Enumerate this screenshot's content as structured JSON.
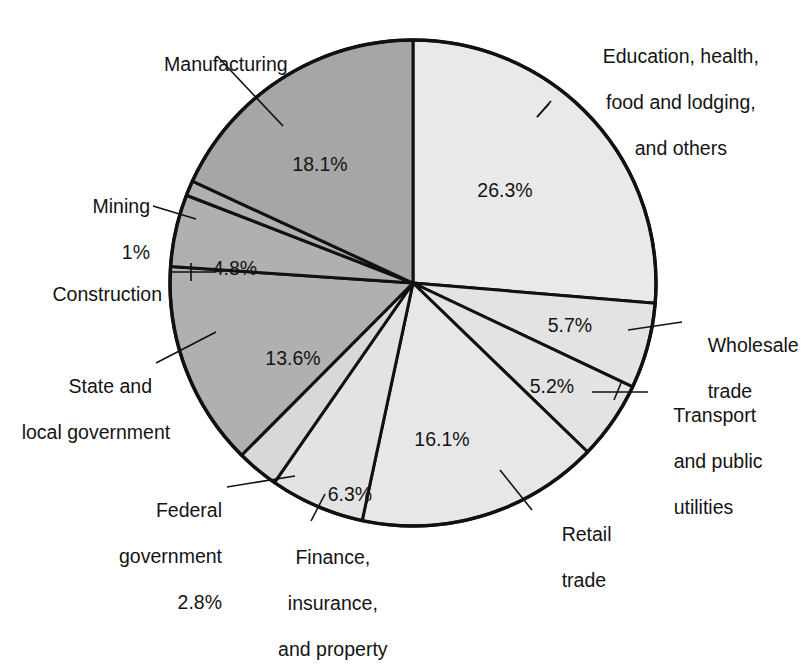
{
  "chart_data": {
    "type": "pie",
    "title": "",
    "subtitle": "",
    "xlabel": "",
    "ylabel": "",
    "legend_position": "none",
    "grid": false,
    "labels_outside": true,
    "total": 100,
    "units": "percent",
    "categories": [
      "Education, health, food and lodging, and others",
      "Wholesale trade",
      "Transport and public utilities",
      "Retail trade",
      "Finance, insurance, and property",
      "Federal government",
      "State and local government",
      "Construction",
      "Mining",
      "Manufacturing"
    ],
    "values": [
      26.3,
      5.7,
      5.2,
      16.1,
      6.3,
      2.8,
      13.6,
      4.8,
      1.0,
      18.1
    ],
    "slices": [
      {
        "id": "education",
        "label": "Education, health,\nfood and lodging,\nand others",
        "value": 26.3,
        "value_text": "26.3%",
        "fill": "#e9e9e9"
      },
      {
        "id": "wholesale",
        "label": "Wholesale\ntrade",
        "value": 5.7,
        "value_text": "5.7%",
        "fill": "#e3e3e3"
      },
      {
        "id": "transport",
        "label": "Transport\nand public\nutilities",
        "value": 5.2,
        "value_text": "5.2%",
        "fill": "#e3e3e3"
      },
      {
        "id": "retail",
        "label": "Retail\ntrade",
        "value": 16.1,
        "value_text": "16.1%",
        "fill": "#e7e7e7"
      },
      {
        "id": "finance",
        "label": "Finance,\ninsurance,\nand property",
        "value": 6.3,
        "value_text": "6.3%",
        "fill": "#e3e3e3"
      },
      {
        "id": "federal",
        "label": "Federal\ngovernment\n2.8%",
        "value": 2.8,
        "value_text": "2.8%",
        "fill": "#d8d8d8"
      },
      {
        "id": "state-local",
        "label": "State and\nlocal government",
        "value": 13.6,
        "value_text": "13.6%",
        "fill": "#b0b0b0"
      },
      {
        "id": "construction",
        "label": "Construction",
        "value": 4.8,
        "value_text": "4.8%",
        "fill": "#b0b0b0"
      },
      {
        "id": "mining",
        "label": "Mining\n1%",
        "value": 1.0,
        "value_text": "1%",
        "fill": "#b0b0b0"
      },
      {
        "id": "manufacturing",
        "label": "Manufacturing",
        "value": 18.1,
        "value_text": "18.1%",
        "fill": "#a6a6a6"
      }
    ]
  },
  "labels": {
    "manufacturing": "Manufacturing",
    "education_l1": "Education, health,",
    "education_l2": "food and lodging,",
    "education_l3": "and others",
    "mining_l1": "Mining",
    "mining_l2": "1%",
    "construction": "Construction",
    "wholesale_l1": "Wholesale",
    "wholesale_l2": "trade",
    "transport_l1": "Transport",
    "transport_l2": "and public",
    "transport_l3": "utilities",
    "state_l1": "State and",
    "state_l2": "local government",
    "federal_l1": "Federal",
    "federal_l2": "government",
    "federal_l3": "2.8%",
    "finance_l1": "Finance,",
    "finance_l2": "insurance,",
    "finance_l3": "and property",
    "retail_l1": "Retail",
    "retail_l2": "trade"
  },
  "percent_labels": {
    "manufacturing": "18.1%",
    "education": "26.3%",
    "construction": "4.8%",
    "state_local": "13.6%",
    "finance": "6.3%",
    "retail": "16.1%",
    "transport": "5.2%",
    "wholesale": "5.7%"
  },
  "style": {
    "background": "#ffffff",
    "stroke": "#111111",
    "text": "#141414"
  }
}
